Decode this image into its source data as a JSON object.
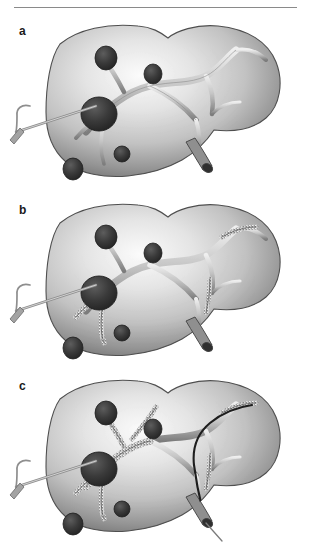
{
  "figure": {
    "kind": "medical-illustration",
    "background_color": "#ffffff",
    "rule_color": "#8a8a8a",
    "panel_count": 3
  },
  "palette": {
    "liver_light": "#f2f2f2",
    "liver_mid": "#b9b9b9",
    "liver_dark": "#6f6f6f",
    "liver_edge": "#4a4a4a",
    "vessel_light": "#e6e6e6",
    "vessel_mid": "#a8a8a8",
    "vessel_dark": "#5e5e5e",
    "tumor_dark": "#303030",
    "tumor_mid": "#4b4b4b",
    "embolized_fill": "#efefef",
    "embolized_speck": "#3a3a3a",
    "catheter_gray": "#9a9a9a",
    "catheter_dark": "#1e1e1e",
    "outline": "#55565a"
  },
  "panels": [
    {
      "id": "a",
      "label": "a",
      "caption_text": "a",
      "stage": "baseline",
      "tumor_count": 5,
      "embolized_branch_count": 0,
      "catheters": [
        "hepatic-artery-catheter-left"
      ],
      "portal_vein_catheter": false
    },
    {
      "id": "b",
      "label": "b",
      "caption_text": "b",
      "stage": "partial-embolization",
      "tumor_count": 5,
      "embolized_branch_count": 3,
      "catheters": [
        "hepatic-artery-catheter-left"
      ],
      "portal_vein_catheter": false
    },
    {
      "id": "c",
      "label": "c",
      "caption_text": "c",
      "stage": "extensive-embolization-with-portal-access",
      "tumor_count": 5,
      "embolized_branch_count": 6,
      "catheters": [
        "hepatic-artery-catheter-left",
        "portal-vein-catheter-right"
      ],
      "portal_vein_catheter": true
    }
  ],
  "tumors": [
    {
      "name": "tumor-upper-left",
      "cx": 106,
      "cy": 44,
      "rx": 11,
      "ry": 12
    },
    {
      "name": "tumor-upper-mid",
      "cx": 153,
      "cy": 60,
      "rx": 9,
      "ry": 10
    },
    {
      "name": "tumor-large-left",
      "cx": 99,
      "cy": 100,
      "rx": 18,
      "ry": 17
    },
    {
      "name": "tumor-lower-mid",
      "cx": 122,
      "cy": 140,
      "rx": 8,
      "ry": 8
    },
    {
      "name": "tumor-lower-left",
      "cx": 73,
      "cy": 155,
      "rx": 10,
      "ry": 11
    }
  ]
}
